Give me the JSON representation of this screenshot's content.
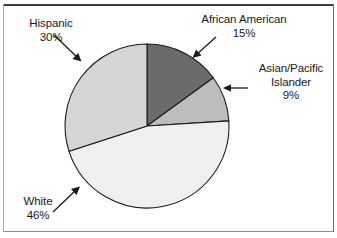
{
  "chart_data": {
    "type": "pie",
    "title": "",
    "subtitle": "",
    "xlabel": "",
    "ylabel": "",
    "legend_position": "none",
    "grid": false,
    "start_angle_deg": 0,
    "direction": "clockwise",
    "categories": [
      "African American",
      "Asian/Pacific Islander",
      "White",
      "Hispanic"
    ],
    "values": [
      15,
      9,
      46,
      30
    ],
    "value_unit": "%",
    "slices": [
      {
        "label": "African American",
        "value": 15,
        "value_text": "15%",
        "color": "#6b6b6b",
        "start_angle_deg": 0,
        "end_angle_deg": 54,
        "label_position": "top-right",
        "callout": "arrow"
      },
      {
        "label": "Asian/Pacific Islander",
        "label_line_1": "Asian/Pacific",
        "label_line_2": "Islander",
        "value": 9,
        "value_text": "9%",
        "color": "#bdbdbd",
        "start_angle_deg": 54,
        "end_angle_deg": 86.4,
        "label_position": "right",
        "callout": "arrow"
      },
      {
        "label": "White",
        "value": 46,
        "value_text": "46%",
        "color": "#efefef",
        "start_angle_deg": 86.4,
        "end_angle_deg": 252,
        "label_position": "bottom-left",
        "callout": "arrow"
      },
      {
        "label": "Hispanic",
        "value": 30,
        "value_text": "30%",
        "color": "#d5d5d5",
        "start_angle_deg": 252,
        "end_angle_deg": 360,
        "label_position": "top-left",
        "callout": "arrow"
      }
    ]
  },
  "labels": {
    "hispanic": {
      "name": "Hispanic",
      "value": "30%"
    },
    "african_american": {
      "name": "African American",
      "value": "15%"
    },
    "asian_pacific": {
      "name_line1": "Asian/Pacific",
      "name_line2": "Islander",
      "value": "9%"
    },
    "white": {
      "name": "White",
      "value": "46%"
    }
  },
  "style": {
    "slice_outline": "#1a1a1a",
    "frame_color": "#3b3b3b",
    "background": "#ffffff"
  }
}
